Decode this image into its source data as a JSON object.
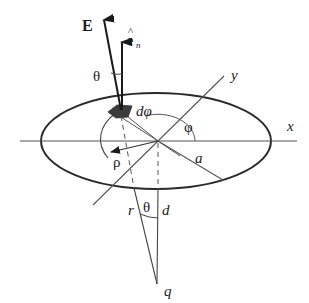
{
  "diagram": {
    "type": "physics-geometry",
    "colors": {
      "line": "#3a3a3a",
      "ink": "#1a1a1a",
      "element_fill": "#3c3c3c",
      "background": "#ffffff"
    },
    "labels": {
      "E": "E",
      "e_n_base": "e",
      "e_n_hat": "^",
      "e_n_sub": "n",
      "theta_top": "θ",
      "d_phi": "dφ",
      "phi": "φ",
      "y_axis": "y",
      "x_axis": "x",
      "rho": "ρ",
      "a": "a",
      "r": "r",
      "theta_bottom": "θ",
      "d": "d",
      "q": "q"
    },
    "geometry": {
      "origin": [
        158,
        141
      ],
      "ellipse": {
        "cx": 156,
        "cy": 141,
        "rx": 115,
        "ry": 48
      },
      "charge_q": [
        157,
        284
      ],
      "surface_element": [
        122,
        110
      ]
    }
  }
}
